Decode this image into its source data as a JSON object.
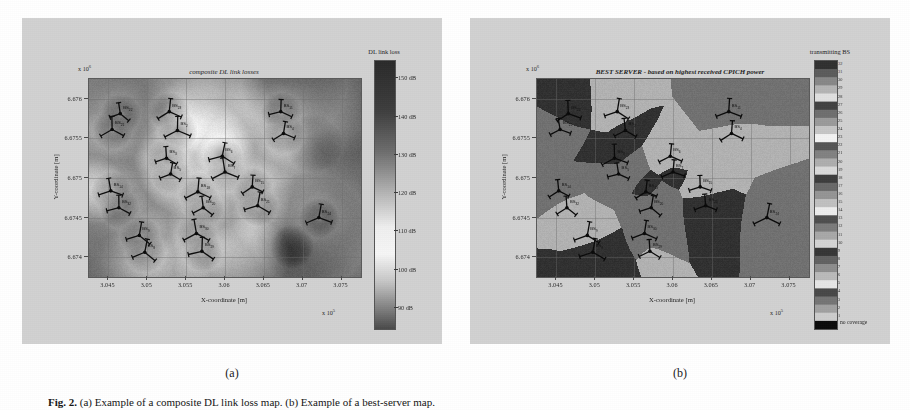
{
  "figure": {
    "caption_label": "Fig. 2.",
    "caption_text": "(a) Example of a composite DL link loss map. (b) Example of a best-server map.",
    "subcaptions": [
      "(a)",
      "(b)"
    ]
  },
  "panel_a": {
    "title": "composite DL link losses",
    "xaxis": {
      "label": "X-coordinate [m]",
      "ticks": [
        "3.045",
        "3.05",
        "3.055",
        "3.06",
        "3.065",
        "3.07",
        "3.075"
      ],
      "exponent": "x 10",
      "exponent_power": "5",
      "range": [
        3.0425,
        3.0785
      ]
    },
    "yaxis": {
      "label": "Y-coordinate [m]",
      "ticks": [
        "6.674",
        "6.6745",
        "6.675",
        "6.6755",
        "6.676"
      ],
      "exponent": "x 10",
      "exponent_power": "6",
      "range": [
        6.6738,
        6.67625
      ]
    },
    "colorbar": {
      "title": "DL link loss",
      "ticks": [
        "150 dB",
        "140 dB",
        "130 dB",
        "120 dB",
        "110 dB",
        "100 dB",
        "90 dB"
      ],
      "values": [
        150,
        140,
        130,
        120,
        110,
        100,
        90
      ],
      "unit": "dB",
      "min": 88,
      "max": 155,
      "orientation": "vertical"
    },
    "bs_sites": [
      {
        "label": "BS",
        "idx": "22",
        "x": 0.115,
        "y": 0.175
      },
      {
        "label": "BS",
        "idx": "21",
        "x": 0.085,
        "y": 0.255
      },
      {
        "label": "BS",
        "idx": "23",
        "x": 0.295,
        "y": 0.165
      },
      {
        "label": "BS",
        "idx": "2",
        "x": 0.325,
        "y": 0.26
      },
      {
        "label": "BS",
        "idx": "11",
        "x": 0.705,
        "y": 0.165
      },
      {
        "label": "BS",
        "idx": "4",
        "x": 0.715,
        "y": 0.275
      },
      {
        "label": "BS",
        "idx": "3",
        "x": 0.285,
        "y": 0.4
      },
      {
        "label": "BS",
        "idx": "5",
        "x": 0.3,
        "y": 0.48
      },
      {
        "label": "BS",
        "idx": "6",
        "x": 0.49,
        "y": 0.39
      },
      {
        "label": "BS",
        "idx": "7",
        "x": 0.5,
        "y": 0.47
      },
      {
        "label": "BS",
        "idx": "14",
        "x": 0.08,
        "y": 0.565
      },
      {
        "label": "BS",
        "idx": "32",
        "x": 0.11,
        "y": 0.65
      },
      {
        "label": "BS",
        "idx": "18",
        "x": 0.4,
        "y": 0.57
      },
      {
        "label": "BS",
        "idx": "20",
        "x": 0.42,
        "y": 0.65
      },
      {
        "label": "BS",
        "idx": "15",
        "x": 0.6,
        "y": 0.545
      },
      {
        "label": "BS",
        "idx": "21",
        "x": 0.62,
        "y": 0.64
      },
      {
        "label": "BS",
        "idx": "24",
        "x": 0.845,
        "y": 0.7
      },
      {
        "label": "BS",
        "idx": "9",
        "x": 0.185,
        "y": 0.79
      },
      {
        "label": "BS",
        "idx": "8",
        "x": 0.205,
        "y": 0.875
      },
      {
        "label": "BS",
        "idx": "30",
        "x": 0.395,
        "y": 0.78
      },
      {
        "label": "BS",
        "idx": "29",
        "x": 0.415,
        "y": 0.87
      }
    ]
  },
  "panel_b": {
    "title": "BEST SERVER - based on highest received CPICH power",
    "xaxis": {
      "label": "X-coordinate [m]",
      "ticks": [
        "3.045",
        "3.05",
        "3.055",
        "3.06",
        "3.065",
        "3.07",
        "3.075"
      ],
      "exponent": "x 10",
      "exponent_power": "5",
      "range": [
        3.0425,
        3.0785
      ]
    },
    "yaxis": {
      "label": "Y-coordinate [m]",
      "ticks": [
        "6.674",
        "6.6745",
        "6.675",
        "6.6755",
        "6.676"
      ],
      "exponent": "x 10",
      "exponent_power": "6",
      "range": [
        6.6738,
        6.67625
      ]
    },
    "colorbar": {
      "title": "transmitting BS",
      "bottom_label": "no coverage",
      "ticks": [
        "32",
        "31",
        "30",
        "29",
        "28",
        "27",
        "26",
        "25",
        "24",
        "23",
        "22",
        "21",
        "20",
        "19",
        "18",
        "17",
        "16",
        "15",
        "14",
        "13",
        "12",
        "11",
        "10",
        "9",
        "8",
        "7",
        "6",
        "5",
        "4",
        "3",
        "2",
        "1"
      ],
      "orientation": "vertical",
      "discrete": true,
      "n_levels": 32
    },
    "bs_sites": [
      {
        "label": "BS",
        "idx": "22",
        "x": 0.115,
        "y": 0.175
      },
      {
        "label": "BS",
        "idx": "21",
        "x": 0.085,
        "y": 0.255
      },
      {
        "label": "BS",
        "idx": "23",
        "x": 0.295,
        "y": 0.165
      },
      {
        "label": "BS",
        "idx": "2",
        "x": 0.325,
        "y": 0.26
      },
      {
        "label": "BS",
        "idx": "11",
        "x": 0.705,
        "y": 0.165
      },
      {
        "label": "BS",
        "idx": "4",
        "x": 0.715,
        "y": 0.275
      },
      {
        "label": "BS",
        "idx": "3",
        "x": 0.285,
        "y": 0.4
      },
      {
        "label": "BS",
        "idx": "5",
        "x": 0.3,
        "y": 0.48
      },
      {
        "label": "BS",
        "idx": "6",
        "x": 0.49,
        "y": 0.39
      },
      {
        "label": "BS",
        "idx": "7",
        "x": 0.5,
        "y": 0.47
      },
      {
        "label": "BS",
        "idx": "14",
        "x": 0.08,
        "y": 0.565
      },
      {
        "label": "BS",
        "idx": "32",
        "x": 0.11,
        "y": 0.65
      },
      {
        "label": "BS",
        "idx": "18",
        "x": 0.4,
        "y": 0.57
      },
      {
        "label": "BS",
        "idx": "20",
        "x": 0.42,
        "y": 0.65
      },
      {
        "label": "BS",
        "idx": "15",
        "x": 0.6,
        "y": 0.545
      },
      {
        "label": "BS",
        "idx": "21",
        "x": 0.62,
        "y": 0.64
      },
      {
        "label": "BS",
        "idx": "24",
        "x": 0.845,
        "y": 0.7
      },
      {
        "label": "BS",
        "idx": "9",
        "x": 0.185,
        "y": 0.79
      },
      {
        "label": "BS",
        "idx": "8",
        "x": 0.205,
        "y": 0.875
      },
      {
        "label": "BS",
        "idx": "30",
        "x": 0.395,
        "y": 0.78
      },
      {
        "label": "BS",
        "idx": "29",
        "x": 0.415,
        "y": 0.87
      }
    ]
  },
  "chart_data": [
    {
      "type": "heatmap",
      "panel": "(a)",
      "title": "composite DL link losses",
      "xlabel": "X-coordinate [m]",
      "ylabel": "Y-coordinate [m]",
      "xlim": [
        304250,
        307850
      ],
      "ylim": [
        6673800,
        6676250
      ],
      "xticks": [
        304500,
        305000,
        305500,
        306000,
        306500,
        307000,
        307500
      ],
      "xticklabels": [
        "3.045",
        "3.05",
        "3.055",
        "3.06",
        "3.065",
        "3.07",
        "3.075"
      ],
      "x_exponent": "x 10^5",
      "yticks": [
        6674000,
        6674500,
        6675000,
        6675500,
        6676000
      ],
      "yticklabels": [
        "6.674",
        "6.6745",
        "6.675",
        "6.6755",
        "6.676"
      ],
      "y_exponent": "x 10^6",
      "grid": true,
      "colorbar": {
        "label": "DL link loss",
        "tick_values": [
          150,
          140,
          130,
          120,
          110,
          100,
          90
        ],
        "tick_labels": [
          "150 dB",
          "140 dB",
          "130 dB",
          "120 dB",
          "110 dB",
          "100 dB",
          "90 dB"
        ],
        "cmin": 88,
        "cmax": 155,
        "colormap": "grayscale (dark = high loss)"
      },
      "markers": {
        "name": "base-station sites",
        "count": 21,
        "labels": [
          "BS22",
          "BS21",
          "BS23",
          "BS2",
          "BS11",
          "BS4",
          "BS3",
          "BS5",
          "BS6",
          "BS7",
          "BS14",
          "BS32",
          "BS18",
          "BS20",
          "BS15",
          "BS21",
          "BS24",
          "BS9",
          "BS8",
          "BS30",
          "BS29"
        ]
      }
    },
    {
      "type": "heatmap",
      "panel": "(b)",
      "title": "BEST SERVER - based on highest received CPICH power",
      "xlabel": "X-coordinate [m]",
      "ylabel": "Y-coordinate [m]",
      "xlim": [
        304250,
        307850
      ],
      "ylim": [
        6673800,
        6676250
      ],
      "xticks": [
        304500,
        305000,
        305500,
        306000,
        306500,
        307000,
        307500
      ],
      "xticklabels": [
        "3.045",
        "3.05",
        "3.055",
        "3.06",
        "3.065",
        "3.07",
        "3.075"
      ],
      "x_exponent": "x 10^5",
      "yticks": [
        6674000,
        6674500,
        6675000,
        6675500,
        6676000
      ],
      "yticklabels": [
        "6.674",
        "6.6745",
        "6.675",
        "6.6755",
        "6.676"
      ],
      "y_exponent": "x 10^6",
      "grid": true,
      "colorbar": {
        "label": "transmitting BS",
        "discrete": true,
        "n_levels": 32,
        "tick_labels": [
          "32",
          "31",
          "30",
          "29",
          "28",
          "27",
          "26",
          "25",
          "24",
          "23",
          "22",
          "21",
          "20",
          "19",
          "18",
          "17",
          "16",
          "15",
          "14",
          "13",
          "12",
          "11",
          "10",
          "9",
          "8",
          "7",
          "6",
          "5",
          "4",
          "3",
          "2",
          "1"
        ],
        "extra_label": "no coverage",
        "colormap": "discrete grayscale (categorical best-server index)"
      },
      "markers": {
        "name": "base-station sites",
        "count": 21,
        "labels": [
          "BS22",
          "BS21",
          "BS23",
          "BS2",
          "BS11",
          "BS4",
          "BS3",
          "BS5",
          "BS6",
          "BS7",
          "BS14",
          "BS32",
          "BS18",
          "BS20",
          "BS15",
          "BS21",
          "BS24",
          "BS9",
          "BS8",
          "BS30",
          "BS29"
        ]
      }
    }
  ]
}
